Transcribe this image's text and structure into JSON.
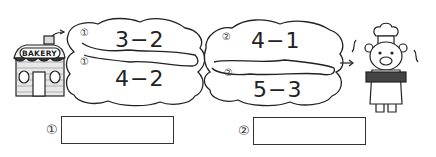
{
  "worksheet": {
    "start_label": "BAKERY",
    "route1": {
      "marker": "①",
      "upper_expression": "3−2",
      "lower_expression": "4−2"
    },
    "route2": {
      "marker": "②",
      "upper_expression": "4−1",
      "lower_expression": "5−3"
    },
    "answers": [
      {
        "marker": "①",
        "value": ""
      },
      {
        "marker": "②",
        "value": ""
      }
    ]
  }
}
